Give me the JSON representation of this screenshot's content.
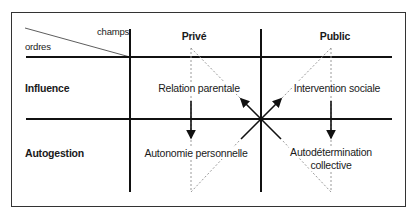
{
  "diagram": {
    "corner": {
      "columns_label": "champs",
      "rows_label": "ordres"
    },
    "columns": [
      {
        "label": "Privé"
      },
      {
        "label": "Public"
      }
    ],
    "rows": [
      {
        "label": "Influence"
      },
      {
        "label": "Autogestion"
      }
    ],
    "cells": {
      "influence_prive": "Relation parentale",
      "influence_public": "Intervention sociale",
      "autogestion_prive": "Autonomie personnelle",
      "autogestion_public_line1": "Autodétermination",
      "autogestion_public_line2": "collective"
    },
    "colors": {
      "line": "#111111",
      "dotted": "#9a9a9a",
      "border": "#333333"
    }
  }
}
